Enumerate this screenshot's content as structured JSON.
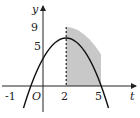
{
  "diagram": {
    "type": "parabola-area",
    "function": "y = -t^2 + 4t + 5",
    "axes": {
      "x_label": "t",
      "y_label": "y",
      "origin_label": "O"
    },
    "x_ticks": [
      "-1",
      "2",
      "5"
    ],
    "y_ticks": [
      "9",
      "5"
    ],
    "vertex": [
      2,
      9
    ],
    "y_intercept": 5,
    "roots": [
      -1,
      5
    ],
    "shaded_region": {
      "from": 2,
      "to": 5
    },
    "colors": {
      "curve": "#111111",
      "shade": "#c8c8c8",
      "axis": "#222222"
    }
  }
}
